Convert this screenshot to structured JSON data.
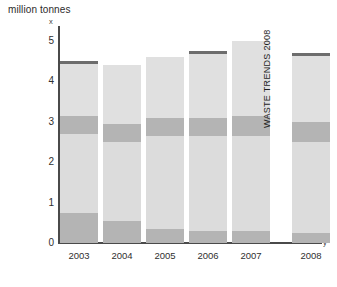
{
  "chart_data": {
    "type": "bar",
    "title": "",
    "ylabel": "million tonnes",
    "xlabel": "",
    "ylim": [
      0,
      5.3
    ],
    "yticks": [
      0,
      1,
      2,
      3,
      4,
      5
    ],
    "ytick_labels": [
      "0",
      "1",
      "2",
      "3",
      "4",
      "5"
    ],
    "categories": [
      "2003",
      "2004",
      "2005",
      "2006",
      "2007",
      "2008"
    ],
    "grid": false,
    "legend": "none",
    "stacked": true,
    "series": [
      {
        "name": "bottom-band",
        "values": [
          0.75,
          0.55,
          0.35,
          0.3,
          0.3,
          0.25
        ]
      },
      {
        "name": "lower-light",
        "values": [
          1.95,
          1.95,
          2.3,
          2.35,
          2.35,
          2.25
        ]
      },
      {
        "name": "middle-band",
        "values": [
          0.45,
          0.45,
          0.45,
          0.45,
          0.5,
          0.5
        ]
      },
      {
        "name": "upper-light",
        "values": [
          1.35,
          1.45,
          1.5,
          1.65,
          1.85,
          1.7
        ]
      }
    ],
    "totals": [
      4.5,
      4.4,
      4.6,
      4.75,
      5.0,
      4.7
    ],
    "caps": [
      true,
      false,
      false,
      true,
      false,
      true
    ],
    "annotations": [
      {
        "text": "WASTE TRENDS 2008",
        "orientation": "vertical"
      },
      {
        "text": "x",
        "role": "y-axis-end-marker"
      },
      {
        "text": "y",
        "role": "x-axis-end-marker"
      }
    ]
  },
  "colors": {
    "cap": "#6d6d6d",
    "band": "#b4b4b4",
    "light": "#e0e0e0",
    "light_alt": "#dcdcdc",
    "axis": "#4a4a4a",
    "text": "#2f2f2f"
  },
  "axis": {
    "title": "million tonnes",
    "x_end_marker": "x",
    "y_end_marker": "y"
  },
  "watermark": {
    "text": "WASTE TRENDS 2008"
  }
}
